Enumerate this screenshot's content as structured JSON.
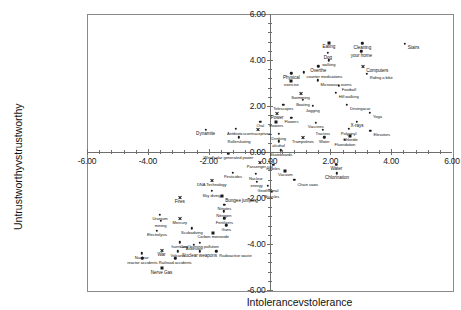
{
  "chart_data": {
    "type": "scatter",
    "title": "",
    "xlabel": "Intolerancevstolerance",
    "ylabel": "Untrustworthyvstrustworthy",
    "xlim": [
      -6,
      6
    ],
    "ylim": [
      -6,
      6
    ],
    "xticks": [
      "-6.00",
      "-4.00",
      "-2.00",
      "0.00",
      "2.00",
      "4.00",
      "6.00"
    ],
    "yticks": [
      "6.00",
      "4.00",
      "2.00",
      "0.00",
      "-2.00",
      "-4.00",
      "-6.00"
    ],
    "xtick_values": [
      -6,
      -4,
      -2,
      0,
      2,
      4,
      6
    ],
    "ytick_values": [
      6,
      4,
      2,
      0,
      -2,
      -4,
      -6
    ],
    "grid": false,
    "legend": "none",
    "axes_cross_at_origin": true,
    "marker": "small black dot",
    "points": [
      {
        "label": "Eating",
        "x": 1.95,
        "y": 4.75,
        "anchor": "center",
        "size": "mid"
      },
      {
        "label": "Cleaning",
        "x": 3.05,
        "y": 4.72,
        "anchor": "center",
        "size": "mid"
      },
      {
        "label": "your home",
        "x": 3.02,
        "y": 4.38,
        "anchor": "center",
        "size": "mid"
      },
      {
        "label": "Stairs",
        "x": 4.45,
        "y": 4.7,
        "anchor": "left",
        "size": "mid"
      },
      {
        "label": "Dog",
        "x": 1.92,
        "y": 4.3,
        "anchor": "center",
        "size": "mid"
      },
      {
        "label": "walking",
        "x": 1.95,
        "y": 3.98,
        "anchor": "center",
        "size": "small"
      },
      {
        "label": "Overthe",
        "x": 1.6,
        "y": 3.72,
        "anchor": "center",
        "size": "mid"
      },
      {
        "label": "Computers",
        "x": 3.08,
        "y": 3.72,
        "anchor": "left",
        "size": "mid"
      },
      {
        "label": "Physical",
        "x": 0.72,
        "y": 3.42,
        "anchor": "center",
        "size": "mid"
      },
      {
        "label": "counter medications",
        "x": 1.12,
        "y": 3.46,
        "anchor": "left",
        "size": "small"
      },
      {
        "label": "Riding a bike",
        "x": 3.2,
        "y": 3.4,
        "anchor": "left",
        "size": "small"
      },
      {
        "label": "exercise",
        "x": 0.72,
        "y": 3.1,
        "anchor": "center",
        "size": "small"
      },
      {
        "label": "Microwave ovens",
        "x": 1.58,
        "y": 3.12,
        "anchor": "left",
        "size": "small"
      },
      {
        "label": "Football",
        "x": 2.28,
        "y": 2.88,
        "anchor": "left",
        "size": "small"
      },
      {
        "label": "Swimming",
        "x": 1.02,
        "y": 2.56,
        "anchor": "center",
        "size": "small"
      },
      {
        "label": "Hill walking",
        "x": 2.18,
        "y": 2.58,
        "anchor": "left",
        "size": "small"
      },
      {
        "label": "Boating",
        "x": 1.1,
        "y": 2.26,
        "anchor": "center",
        "size": "small"
      },
      {
        "label": "Telescopes",
        "x": 0.45,
        "y": 2.06,
        "anchor": "center",
        "size": "small"
      },
      {
        "label": "Jogging",
        "x": 1.42,
        "y": 2.0,
        "anchor": "center",
        "size": "small"
      },
      {
        "label": "Drivingacar",
        "x": 2.55,
        "y": 2.06,
        "anchor": "left",
        "size": "small"
      },
      {
        "label": "Yoga",
        "x": 3.3,
        "y": 1.7,
        "anchor": "left",
        "size": "small"
      },
      {
        "label": "Power",
        "x": 0.25,
        "y": 1.66,
        "anchor": "center",
        "size": "mid"
      },
      {
        "label": "mowers",
        "x": 0.22,
        "y": 1.32,
        "anchor": "center",
        "size": "small"
      },
      {
        "label": "Flowers",
        "x": 0.72,
        "y": 1.5,
        "anchor": "center",
        "size": "small"
      },
      {
        "label": "Oral",
        "x": -0.3,
        "y": 1.32,
        "anchor": "center",
        "size": "small"
      },
      {
        "label": "Vaccines",
        "x": 1.52,
        "y": 1.28,
        "anchor": "center",
        "size": "small"
      },
      {
        "label": "X-rays",
        "x": 2.88,
        "y": 1.32,
        "anchor": "center",
        "size": "mid"
      },
      {
        "label": "Antibiotics",
        "x": -1.1,
        "y": 1.0,
        "anchor": "center",
        "size": "small"
      },
      {
        "label": "contraceptives",
        "x": -0.38,
        "y": 1.0,
        "anchor": "center",
        "size": "small"
      },
      {
        "label": "Tractors",
        "x": 1.75,
        "y": 0.96,
        "anchor": "center",
        "size": "small"
      },
      {
        "label": "Polyvinyl",
        "x": 2.6,
        "y": 1.0,
        "anchor": "center",
        "size": "small"
      },
      {
        "label": "Elevators",
        "x": 3.32,
        "y": 0.92,
        "anchor": "left",
        "size": "small"
      },
      {
        "label": "Drinking",
        "x": 0.3,
        "y": 0.78,
        "anchor": "center",
        "size": "small"
      },
      {
        "label": "Chloride",
        "x": 2.66,
        "y": 0.7,
        "anchor": "center",
        "size": "small"
      },
      {
        "label": "Rollerskating",
        "x": -1.0,
        "y": 0.64,
        "anchor": "center",
        "size": "small"
      },
      {
        "label": "Trampolines",
        "x": 1.1,
        "y": 0.64,
        "anchor": "center",
        "size": "small"
      },
      {
        "label": "Water",
        "x": 1.8,
        "y": 0.64,
        "anchor": "center",
        "size": "small"
      },
      {
        "label": "Fluoridation",
        "x": 2.48,
        "y": 0.52,
        "anchor": "center",
        "size": "small"
      },
      {
        "label": "alcohol",
        "x": 0.3,
        "y": 0.46,
        "anchor": "center",
        "size": "small"
      },
      {
        "label": "Dynamite",
        "x": -2.1,
        "y": 0.96,
        "anchor": "center",
        "size": "mid"
      },
      {
        "label": "Skateboards",
        "x": 0.38,
        "y": 0.08,
        "anchor": "center",
        "size": "small"
      },
      {
        "label": "Wind/solar generated power",
        "x": -1.35,
        "y": -0.08,
        "anchor": "center",
        "size": "small"
      },
      {
        "label": "Passenger-car",
        "x": -0.32,
        "y": -0.44,
        "anchor": "center",
        "size": "small"
      },
      {
        "label": "mobiles",
        "x": 0.12,
        "y": -0.56,
        "anchor": "center",
        "size": "small"
      },
      {
        "label": "Vacuum",
        "x": 0.52,
        "y": -0.82,
        "anchor": "center",
        "size": "small"
      },
      {
        "label": "Water",
        "x": 2.2,
        "y": -0.56,
        "anchor": "center",
        "size": "mid"
      },
      {
        "label": "Chlorination",
        "x": 2.22,
        "y": -0.92,
        "anchor": "center",
        "size": "mid"
      },
      {
        "label": "Pesticides",
        "x": -1.2,
        "y": -0.9,
        "anchor": "center",
        "size": "small"
      },
      {
        "label": "Nuclear",
        "x": -0.45,
        "y": -0.96,
        "anchor": "center",
        "size": "small"
      },
      {
        "label": "DNA Technology",
        "x": -1.9,
        "y": -1.24,
        "anchor": "center",
        "size": "small"
      },
      {
        "label": "Chain saws",
        "x": 0.82,
        "y": -1.22,
        "anchor": "left",
        "size": "small"
      },
      {
        "label": "energy",
        "x": -0.42,
        "y": -1.3,
        "anchor": "center",
        "size": "small"
      },
      {
        "label": "Geothermal",
        "x": -0.05,
        "y": -1.48,
        "anchor": "center",
        "size": "small"
      },
      {
        "label": "Bicycles",
        "x": 0.08,
        "y": -1.74,
        "anchor": "center",
        "size": "small"
      },
      {
        "label": "Sky diving",
        "x": -1.9,
        "y": -1.7,
        "anchor": "center",
        "size": "small"
      },
      {
        "label": "Bungee jumping",
        "x": -1.55,
        "y": -1.92,
        "anchor": "left",
        "size": "mid"
      },
      {
        "label": "Fires",
        "x": -2.95,
        "y": -1.98,
        "anchor": "center",
        "size": "mid"
      },
      {
        "label": "Nitrates",
        "x": -1.48,
        "y": -2.3,
        "anchor": "center",
        "size": "small"
      },
      {
        "label": "Nitrogen",
        "x": -1.5,
        "y": -2.58,
        "anchor": "center",
        "size": "small"
      },
      {
        "label": "Fertilizers",
        "x": -1.48,
        "y": -2.88,
        "anchor": "center",
        "size": "small"
      },
      {
        "label": "Guns",
        "x": -1.42,
        "y": -3.18,
        "anchor": "center",
        "size": "small"
      },
      {
        "label": "Uranium",
        "x": -3.6,
        "y": -2.72,
        "anchor": "center",
        "size": "small"
      },
      {
        "label": "mining",
        "x": -3.58,
        "y": -3.0,
        "anchor": "center",
        "size": "small"
      },
      {
        "label": "Mercury",
        "x": -2.95,
        "y": -2.9,
        "anchor": "center",
        "size": "small"
      },
      {
        "label": "Scubadiving",
        "x": -2.55,
        "y": -3.32,
        "anchor": "center",
        "size": "small"
      },
      {
        "label": "Electrolysis",
        "x": -3.7,
        "y": -3.42,
        "anchor": "center",
        "size": "small"
      },
      {
        "label": "Carbon monoxide",
        "x": -1.85,
        "y": -3.52,
        "anchor": "center",
        "size": "small"
      },
      {
        "label": "Coal burning pollution",
        "x": -2.3,
        "y": -3.95,
        "anchor": "center",
        "size": "small"
      },
      {
        "label": "hurricane",
        "x": -2.95,
        "y": -3.92,
        "anchor": "center",
        "size": "small"
      },
      {
        "label": "Asbestos",
        "x": -2.48,
        "y": -4.04,
        "anchor": "center",
        "size": "small"
      },
      {
        "label": "War",
        "x": -3.55,
        "y": -4.28,
        "anchor": "center",
        "size": "mid"
      },
      {
        "label": "Volcano",
        "x": -3.02,
        "y": -4.32,
        "anchor": "center",
        "size": "small"
      },
      {
        "label": "Nuclear weapons",
        "x": -2.3,
        "y": -4.32,
        "anchor": "center",
        "size": "mid"
      },
      {
        "label": "Radioactive waste",
        "x": -1.75,
        "y": -4.32,
        "anchor": "left",
        "size": "small"
      },
      {
        "label": "Nuclear",
        "x": -4.2,
        "y": -4.4,
        "anchor": "center",
        "size": "small"
      },
      {
        "label": "reactor accidents",
        "x": -4.18,
        "y": -4.62,
        "anchor": "center",
        "size": "small"
      },
      {
        "label": "Railroad accidents",
        "x": -3.1,
        "y": -4.62,
        "anchor": "center",
        "size": "small"
      },
      {
        "label": "Nerve Gas",
        "x": -3.55,
        "y": -5.05,
        "anchor": "center",
        "size": "mid"
      }
    ]
  }
}
